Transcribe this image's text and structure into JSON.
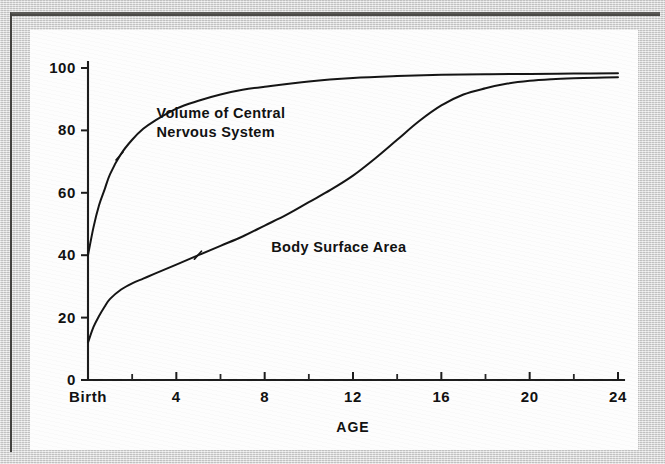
{
  "figure": {
    "panel_background": "#fdfdfd",
    "border_color": "#d7d7d7",
    "ink_color": "#141414"
  },
  "chart_data": {
    "type": "line",
    "title": "",
    "subtitle": "",
    "xlabel": "AGE",
    "ylabel": "",
    "xlim": [
      0,
      24
    ],
    "ylim": [
      0,
      100
    ],
    "grid": false,
    "legend_position": "inline-annotation",
    "x_tick_labels": [
      "Birth",
      "4",
      "8",
      "12",
      "16",
      "20",
      "24"
    ],
    "x_tick_values": [
      0,
      4,
      8,
      12,
      16,
      20,
      24
    ],
    "x_minor_tick_values": [
      2,
      6,
      10,
      14,
      18,
      22
    ],
    "y_tick_labels": [
      "0",
      "20",
      "40",
      "60",
      "80",
      "100"
    ],
    "y_tick_values": [
      0,
      20,
      40,
      60,
      80,
      100
    ],
    "series": [
      {
        "name": "Volume of Central Nervous System",
        "label_line1": "Volume of Central",
        "label_line2": "Nervous System",
        "label_x": 3.1,
        "label_y": 84,
        "x": [
          0,
          0.25,
          0.5,
          0.75,
          1,
          1.5,
          2,
          2.5,
          3,
          4,
          5,
          6,
          7,
          8,
          10,
          12,
          14,
          16,
          18,
          20,
          22,
          24
        ],
        "y": [
          40,
          49,
          56,
          61,
          66,
          72.5,
          77,
          80.5,
          83,
          87,
          89.5,
          91.5,
          93,
          94,
          95.7,
          96.8,
          97.4,
          97.8,
          98,
          98.1,
          98.2,
          98.3
        ]
      },
      {
        "name": "Body Surface Area",
        "label_line1": "Body Surface Area",
        "label_line2": "",
        "label_x": 8.3,
        "label_y": 41,
        "x": [
          0,
          0.25,
          0.5,
          0.75,
          1,
          1.5,
          2,
          2.5,
          3,
          4,
          5,
          6,
          7,
          8,
          9,
          10,
          11,
          12,
          13,
          14,
          15,
          16,
          17,
          18,
          19,
          20,
          21,
          22,
          23,
          24
        ],
        "y": [
          12,
          17,
          20.5,
          23.5,
          26,
          29,
          31,
          32.5,
          34,
          37,
          40,
          43,
          46,
          49.5,
          53,
          57,
          61,
          65.5,
          71,
          77,
          83,
          88,
          91.5,
          93.5,
          95,
          95.9,
          96.4,
          96.7,
          96.9,
          97
        ]
      }
    ],
    "series_markers": [
      {
        "series": 0,
        "x": 1.45,
        "y": 71.8
      },
      {
        "series": 1,
        "x": 5.0,
        "y": 40.0
      }
    ]
  }
}
